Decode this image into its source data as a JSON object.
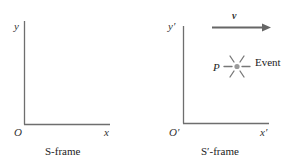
{
  "frames": [
    {
      "id": "S",
      "caption": "S-frame",
      "origin_label": "O",
      "x_label": "x",
      "y_label": "y"
    },
    {
      "id": "S-prime",
      "caption": "S′-frame",
      "origin_label": "O′",
      "x_label": "x′",
      "y_label": "y′",
      "velocity_label": "v",
      "event": {
        "point_label": "P",
        "label": "Event",
        "icon": "starburst-icon"
      }
    }
  ],
  "colors": {
    "axis": "#6e6e6e",
    "arrow": "#666666",
    "event_dot": "#9a9a9a",
    "text": "#333333"
  }
}
